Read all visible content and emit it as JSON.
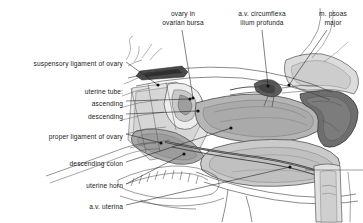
{
  "figure": {
    "type": "anatomical-illustration",
    "background_color": "#ffffff",
    "ink_color": "#2b2b2b",
    "fills": {
      "organ_light": "#cfcfcf",
      "organ_mid": "#b3b3b3",
      "organ_dark": "#8f8f8f",
      "muscle_dark": "#6e6e6e",
      "ligament_dark": "#4a4a4a",
      "highlight": "#ededed"
    }
  },
  "labels": [
    {
      "id": "ovary-in-ovarian-bursa",
      "text_lines": [
        "ovary in",
        "ovarian bursa"
      ],
      "align": "center",
      "x": 152,
      "y": 10,
      "width": 62
    },
    {
      "id": "av-circumflexa-ilium-profunda",
      "text_lines": [
        "a.v. circumflexa",
        "ilium profunda"
      ],
      "align": "center",
      "x": 224,
      "y": 10,
      "width": 76
    },
    {
      "id": "m-psoas-major",
      "text_lines": [
        "m. psoas",
        "major"
      ],
      "align": "center",
      "x": 310,
      "y": 10,
      "width": 46
    },
    {
      "id": "suspensory-ligament-of-ovary",
      "text_lines": [
        "suspensory ligament of ovary"
      ],
      "align": "right",
      "x": 8,
      "y": 60,
      "width": 115
    },
    {
      "id": "uterine-tube",
      "text_lines": [
        "uterine tube:"
      ],
      "align": "right",
      "x": 8,
      "y": 88,
      "width": 115
    },
    {
      "id": "ascending",
      "text_lines": [
        "ascending"
      ],
      "align": "right",
      "x": 8,
      "y": 100,
      "width": 115
    },
    {
      "id": "descending",
      "text_lines": [
        "descending"
      ],
      "align": "right",
      "x": 8,
      "y": 113,
      "width": 115
    },
    {
      "id": "proper-ligament-of-ovary",
      "text_lines": [
        "proper ligament of ovary"
      ],
      "align": "right",
      "x": 8,
      "y": 133,
      "width": 115
    },
    {
      "id": "descending-colon",
      "text_lines": [
        "descending colon"
      ],
      "align": "right",
      "x": 8,
      "y": 160,
      "width": 115
    },
    {
      "id": "uterine-horn",
      "text_lines": [
        "uterine horn"
      ],
      "align": "right",
      "x": 8,
      "y": 182,
      "width": 115
    },
    {
      "id": "av-uterina",
      "text_lines": [
        "a.v. uterina"
      ],
      "align": "right",
      "x": 8,
      "y": 203,
      "width": 115
    }
  ],
  "leader_lines": [
    {
      "id": "leader-ovary-in-ovarian-bursa",
      "from": [
        182,
        30
      ],
      "to": [
        193,
        98
      ],
      "marker": true
    },
    {
      "id": "leader-av-circumflexa",
      "from": [
        262,
        30
      ],
      "to": [
        268,
        86
      ],
      "marker": true
    },
    {
      "id": "leader-m-psoas-major",
      "from": [
        327,
        30
      ],
      "to": [
        289,
        85
      ],
      "marker": true
    },
    {
      "id": "leader-suspensory-ligament",
      "from": [
        126,
        62
      ],
      "to": [
        158,
        85
      ],
      "marker": true
    },
    {
      "id": "leader-uterine-tube-ascending",
      "from": [
        126,
        101
      ],
      "to": [
        190,
        99
      ],
      "marker": true
    },
    {
      "id": "leader-uterine-tube-descending",
      "from": [
        126,
        114
      ],
      "to": [
        198,
        111
      ],
      "marker": true
    },
    {
      "id": "leader-proper-ligament",
      "from": [
        126,
        134
      ],
      "to": [
        161,
        143
      ],
      "marker": true
    },
    {
      "id": "leader-descending-colon",
      "from": [
        126,
        162
      ],
      "to": [
        231,
        128
      ],
      "marker": true
    },
    {
      "id": "leader-uterine-horn",
      "from": [
        126,
        184
      ],
      "to": [
        184,
        154
      ],
      "marker": true
    },
    {
      "id": "leader-av-uterina",
      "from": [
        126,
        205
      ],
      "to": [
        290,
        167
      ],
      "marker": true
    }
  ]
}
